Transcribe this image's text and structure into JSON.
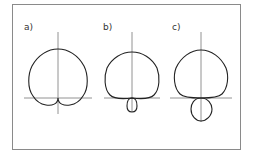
{
  "figure": {
    "panels": [
      {
        "label": "a)",
        "pattern": "cardioid-like with two small rear lobes"
      },
      {
        "label": "b)",
        "pattern": "supercardioid with small rear lobe"
      },
      {
        "label": "c)",
        "pattern": "hypercardioid with larger rear lobe"
      }
    ]
  }
}
